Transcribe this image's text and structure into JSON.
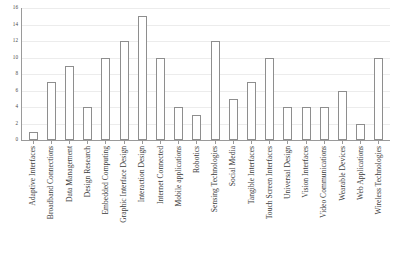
{
  "chart_data": {
    "type": "bar",
    "title": "",
    "xlabel": "",
    "ylabel": "",
    "ylim": [
      0,
      16
    ],
    "ytick_step": 2,
    "yticks": [
      0,
      2,
      4,
      6,
      8,
      10,
      12,
      14,
      16
    ],
    "grid": true,
    "legend": false,
    "bar_fill_color": "#ffffff",
    "bar_edge_color": "#8e8e8e",
    "gridline_color": "#ececec",
    "axis_color": "#9a9a9a",
    "categories": [
      "Adaptive Interfaces",
      "Broadband Connections",
      "Data Management",
      "Design Research",
      "Embedded Computing",
      "Graphic Interface Design",
      "Interaction Design",
      "Internet Connected",
      "Mobile applications",
      "Robotics",
      "Sensing Technologies",
      "Social Media",
      "Tangible Interfaces",
      "Touch Screen Interfaces",
      "Universal Design",
      "Vision Interfaces",
      "Video Communications",
      "Wearable Devices",
      "Web Applications",
      "Wireless Technologies"
    ],
    "values": [
      1,
      7,
      9,
      4,
      10,
      12,
      15,
      10,
      4,
      3,
      12,
      5,
      7,
      10,
      4,
      4,
      4,
      6,
      2,
      10
    ]
  }
}
